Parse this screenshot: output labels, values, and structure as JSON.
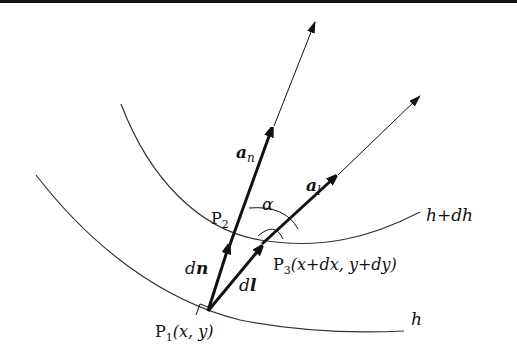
{
  "diagram": {
    "curves": [
      {
        "id": "curve-h",
        "label": "h"
      },
      {
        "id": "curve-h-plus-dh",
        "label": "h+dh"
      }
    ],
    "points": {
      "p1": {
        "name": "P",
        "sub": "1",
        "coords": "(x, y)"
      },
      "p2": {
        "name": "P",
        "sub": "2"
      },
      "p3": {
        "name": "P",
        "sub": "3",
        "coords": "(x+dx, y+dy)"
      }
    },
    "vectors": {
      "dn": {
        "d": "d",
        "v": "n"
      },
      "dl": {
        "d": "d",
        "v": "l"
      },
      "an": {
        "v": "a",
        "sub": "n"
      },
      "al": {
        "v": "a",
        "sub": "l"
      }
    },
    "angle": {
      "label": "α"
    },
    "colors": {
      "stroke": "#111111",
      "curve": "#333333",
      "background": "#ffffff"
    }
  }
}
